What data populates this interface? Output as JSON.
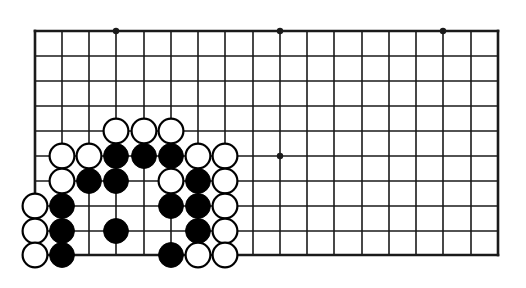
{
  "diagram": {
    "kind": "go-board-diagram",
    "background_color": "#ffffff",
    "line_color": "#1a1a1a",
    "black_stone_color": "#000000",
    "white_stone_color": "#ffffff",
    "white_stone_outline_color": "#000000"
  },
  "board": {
    "left_edge_x": 35,
    "top_edge_x": 31,
    "right_edge_x": 498,
    "bottom_edge_y": 255,
    "column_spacing": 27.2,
    "row_spacing": 24.9,
    "columns": 18,
    "rows": 10,
    "edge_line_width": 2.6,
    "inner_line_width": 1.6,
    "stone_radius": 12.4,
    "column_x": [
      35,
      62,
      89,
      116,
      144,
      171,
      198,
      225,
      253,
      280,
      307,
      334,
      362,
      389,
      416,
      443,
      471,
      498
    ],
    "row_y": [
      31,
      56,
      81,
      106,
      131,
      156,
      181,
      206,
      231,
      255
    ]
  },
  "star_points": [
    {
      "col": 3,
      "row": 0
    },
    {
      "col": 9,
      "row": 0
    },
    {
      "col": 15,
      "row": 0
    },
    {
      "col": 9,
      "row": 5
    }
  ],
  "stones": [
    {
      "color": "white",
      "col": 3,
      "row": 4
    },
    {
      "color": "white",
      "col": 4,
      "row": 4
    },
    {
      "color": "white",
      "col": 5,
      "row": 4
    },
    {
      "color": "white",
      "col": 1,
      "row": 5
    },
    {
      "color": "white",
      "col": 2,
      "row": 5
    },
    {
      "color": "black",
      "col": 3,
      "row": 5
    },
    {
      "color": "black",
      "col": 4,
      "row": 5
    },
    {
      "color": "black",
      "col": 5,
      "row": 5
    },
    {
      "color": "white",
      "col": 6,
      "row": 5
    },
    {
      "color": "white",
      "col": 7,
      "row": 5
    },
    {
      "color": "white",
      "col": 1,
      "row": 6
    },
    {
      "color": "black",
      "col": 2,
      "row": 6
    },
    {
      "color": "black",
      "col": 3,
      "row": 6
    },
    {
      "color": "white",
      "col": 5,
      "row": 6
    },
    {
      "color": "black",
      "col": 6,
      "row": 6
    },
    {
      "color": "white",
      "col": 7,
      "row": 6
    },
    {
      "color": "white",
      "col": 0,
      "row": 7
    },
    {
      "color": "black",
      "col": 1,
      "row": 7
    },
    {
      "color": "black",
      "col": 5,
      "row": 7
    },
    {
      "color": "black",
      "col": 6,
      "row": 7
    },
    {
      "color": "white",
      "col": 7,
      "row": 7
    },
    {
      "color": "white",
      "col": 0,
      "row": 8
    },
    {
      "color": "black",
      "col": 1,
      "row": 8
    },
    {
      "color": "black",
      "col": 3,
      "row": 8
    },
    {
      "color": "black",
      "col": 6,
      "row": 8
    },
    {
      "color": "white",
      "col": 7,
      "row": 8
    },
    {
      "color": "white",
      "col": 0,
      "row": 9
    },
    {
      "color": "black",
      "col": 1,
      "row": 9
    },
    {
      "color": "black",
      "col": 5,
      "row": 9
    },
    {
      "color": "white",
      "col": 6,
      "row": 9
    },
    {
      "color": "white",
      "col": 7,
      "row": 9
    }
  ]
}
